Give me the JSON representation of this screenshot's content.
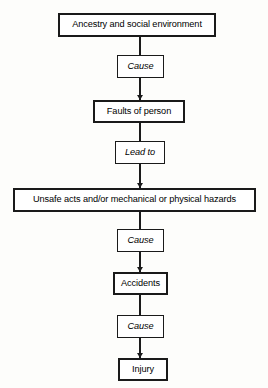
{
  "diagram": {
    "orientation": "vertical",
    "accent_color": "#1a1a1a",
    "background_color": "#fdfdfb",
    "box_fill": "#ffffff",
    "nodes": [
      {
        "id": "ancestry",
        "label": "Ancestry and social environment",
        "kind": "stage",
        "x": 58,
        "y": 13,
        "width": 158,
        "height": 24
      },
      {
        "id": "cause1",
        "label": "Cause",
        "kind": "connector",
        "x": 117,
        "y": 55,
        "width": 47,
        "height": 23
      },
      {
        "id": "faults",
        "label": "Faults of person",
        "kind": "stage",
        "x": 93,
        "y": 100,
        "width": 92,
        "height": 23
      },
      {
        "id": "leadto",
        "label": "Lead to",
        "kind": "connector",
        "x": 115,
        "y": 141,
        "width": 50,
        "height": 23
      },
      {
        "id": "unsafe",
        "label": "Unsafe acts and/or mechanical or physical hazards",
        "kind": "stage",
        "x": 13,
        "y": 188,
        "width": 243,
        "height": 24
      },
      {
        "id": "cause2",
        "label": "Cause",
        "kind": "connector",
        "x": 117,
        "y": 229,
        "width": 47,
        "height": 23
      },
      {
        "id": "accidents",
        "label": "Accidents",
        "kind": "stage",
        "x": 113,
        "y": 272,
        "width": 55,
        "height": 23
      },
      {
        "id": "cause3",
        "label": "Cause",
        "kind": "connector",
        "x": 117,
        "y": 315,
        "width": 47,
        "height": 23
      },
      {
        "id": "injury",
        "label": "Injury",
        "kind": "stage",
        "x": 118,
        "y": 358,
        "width": 50,
        "height": 23
      }
    ],
    "edges": [
      {
        "id": "e1",
        "from": "ancestry",
        "to": "cause1",
        "x": 140,
        "y": 37,
        "length": 18,
        "arrow": false
      },
      {
        "id": "e2",
        "from": "cause1",
        "to": "faults",
        "x": 140,
        "y": 78,
        "length": 22,
        "arrow": true
      },
      {
        "id": "e3",
        "from": "faults",
        "to": "leadto",
        "x": 140,
        "y": 123,
        "length": 18,
        "arrow": false
      },
      {
        "id": "e4",
        "from": "leadto",
        "to": "unsafe",
        "x": 140,
        "y": 164,
        "length": 24,
        "arrow": true
      },
      {
        "id": "e5",
        "from": "unsafe",
        "to": "cause2",
        "x": 140,
        "y": 212,
        "length": 17,
        "arrow": false
      },
      {
        "id": "e6",
        "from": "cause2",
        "to": "accidents",
        "x": 140,
        "y": 252,
        "length": 20,
        "arrow": true
      },
      {
        "id": "e7",
        "from": "accidents",
        "to": "cause3",
        "x": 140,
        "y": 295,
        "length": 20,
        "arrow": false
      },
      {
        "id": "e8",
        "from": "cause3",
        "to": "injury",
        "x": 140,
        "y": 338,
        "length": 20,
        "arrow": true
      }
    ]
  }
}
